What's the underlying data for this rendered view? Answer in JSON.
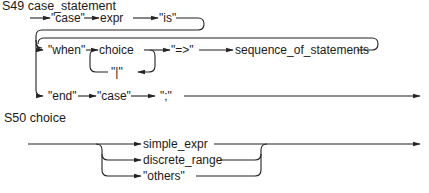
{
  "diagrams": [
    {
      "title": "S49 case_statement",
      "nodes": {
        "case_kw": "\"case\"",
        "expr": "expr",
        "is_kw": "\"is\"",
        "when_kw": "\"when\"",
        "choice": "choice",
        "bar": "\"|\"",
        "arrow_kw": "\"=>\"",
        "seq": "sequence_of_statements",
        "end_kw": "\"end\"",
        "case_kw2": "\"case\"",
        "semi": "\";\""
      }
    },
    {
      "title": "S50 choice",
      "nodes": {
        "simple_expr": "simple_expr",
        "discrete_range": "discrete_range",
        "others": "\"others\""
      }
    }
  ]
}
